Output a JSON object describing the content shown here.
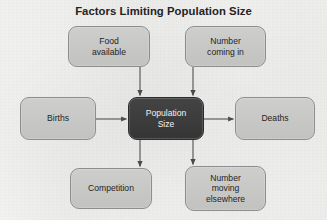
{
  "diagram": {
    "title": "Factors Limiting Population Size",
    "type": "flow-diagram",
    "theme": {
      "background": "#f3f3f1",
      "node_fill": "#c8c8c7",
      "node_border": "#8d8d8d",
      "center_fill": "#3c3c3c",
      "center_text": "#f2f2f2",
      "text": "#1f1f1f",
      "arrow": "#4a4a4a"
    },
    "center_node": {
      "id": "population-size",
      "line1": "Population",
      "line2": "Size"
    },
    "nodes": [
      {
        "id": "food-available",
        "line1": "Food",
        "line2": "available",
        "line3": "",
        "position": "top-left"
      },
      {
        "id": "number-coming-in",
        "line1": "Number",
        "line2": "coming in",
        "line3": "",
        "position": "top-right"
      },
      {
        "id": "births",
        "line1": "Births",
        "line2": "",
        "line3": "",
        "position": "left"
      },
      {
        "id": "deaths",
        "line1": "Deaths",
        "line2": "",
        "line3": "",
        "position": "right"
      },
      {
        "id": "competition",
        "line1": "Competition",
        "line2": "",
        "line3": "",
        "position": "bottom-left"
      },
      {
        "id": "number-moving-elsewhere",
        "line1": "Number",
        "line2": "moving",
        "line3": "elsewhere",
        "position": "bottom-right"
      }
    ],
    "edges": [
      {
        "from": "food-available",
        "to": "population-size",
        "direction": "down"
      },
      {
        "from": "number-coming-in",
        "to": "population-size",
        "direction": "down"
      },
      {
        "from": "births",
        "to": "population-size",
        "direction": "right"
      },
      {
        "from": "population-size",
        "to": "deaths",
        "direction": "right"
      },
      {
        "from": "population-size",
        "to": "competition",
        "direction": "down"
      },
      {
        "from": "population-size",
        "to": "number-moving-elsewhere",
        "direction": "down"
      }
    ]
  }
}
